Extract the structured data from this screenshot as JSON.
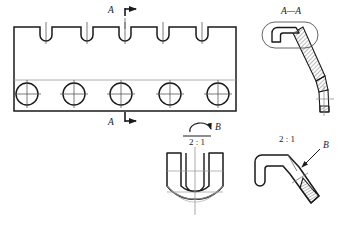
{
  "drawing": {
    "title": "Engineering multi-view drawing of a slotted bar with bent hook rods",
    "background_color": "#ffffff",
    "line_color": "#1a1a1a",
    "thin_line_color": "#555555",
    "center_line_color": "#888888",
    "hatch_color": "#444444",
    "views": {
      "front_view": {
        "name": "front-view",
        "outline": {
          "x": 14,
          "y": 27,
          "width": 222,
          "height": 84
        },
        "slot_count": 5,
        "slot_label": "top slot",
        "slot_centers_x": [
          46,
          87,
          125,
          163,
          202
        ],
        "slot_top_y": 27,
        "slot_depth": 14,
        "slot_half_width": 6,
        "hole_count": 5,
        "hole_label": "through hole",
        "hole_centers_x": [
          27,
          74,
          121,
          170,
          218
        ],
        "hole_center_y": 94,
        "hole_radius": 11,
        "horizontal_center_line_y": 80,
        "section_marker_top": {
          "letter": "A",
          "letter_x": 111,
          "letter_y": 13,
          "line_x": 125,
          "line_top_y": 8,
          "line_bottom_y": 29,
          "arrow_dir": "right"
        },
        "section_marker_bottom": {
          "letter": "A",
          "letter_x": 111,
          "letter_y": 124,
          "line_x": 125,
          "line_top_y": 110,
          "line_bottom_y": 120,
          "arrow_dir": "right"
        }
      },
      "section_aa": {
        "name": "section-a-a",
        "label": "A—A",
        "label_x": 291,
        "label_y": 13,
        "note": "Section A-A through slot showing bent hook rod in cross section",
        "capsule": {
          "cx": 290,
          "cy": 35,
          "rx": 28,
          "ry": 13
        }
      },
      "detail_b_front": {
        "name": "detail-b-front-u-shape",
        "scale_label": "2 : 1",
        "scale_label_x": 196,
        "scale_label_y": 137,
        "letter": "B",
        "letter_x": 219,
        "letter_y": 128,
        "note": "U-shaped enlarged detail with rotation arc symbol"
      },
      "detail_b_side": {
        "name": "detail-b-side-hook",
        "scale_label": "2 : 1",
        "scale_label_x": 287,
        "scale_label_y": 139,
        "letter": "B",
        "letter_x": 324,
        "letter_y": 147,
        "note": "Enlarged side view of hook end with knurled/hatched tip"
      }
    }
  }
}
